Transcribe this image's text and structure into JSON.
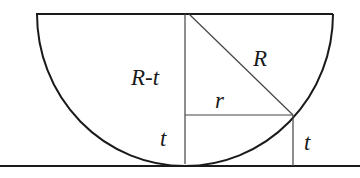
{
  "figure": {
    "colors": {
      "stroke": "#1a1a1a",
      "thin_stroke": "#444444",
      "background": "#ffffff"
    },
    "labels": {
      "r_minus_t": "R-t",
      "big_r": "R",
      "small_r": "r",
      "t_center": "t",
      "t_right": "t"
    },
    "geometry": {
      "center": [
        185,
        14
      ],
      "radius": 151,
      "rim_y": 14,
      "rim_x": [
        37,
        332
      ],
      "ground_y": 166,
      "intersection_point": [
        293,
        115
      ]
    }
  }
}
